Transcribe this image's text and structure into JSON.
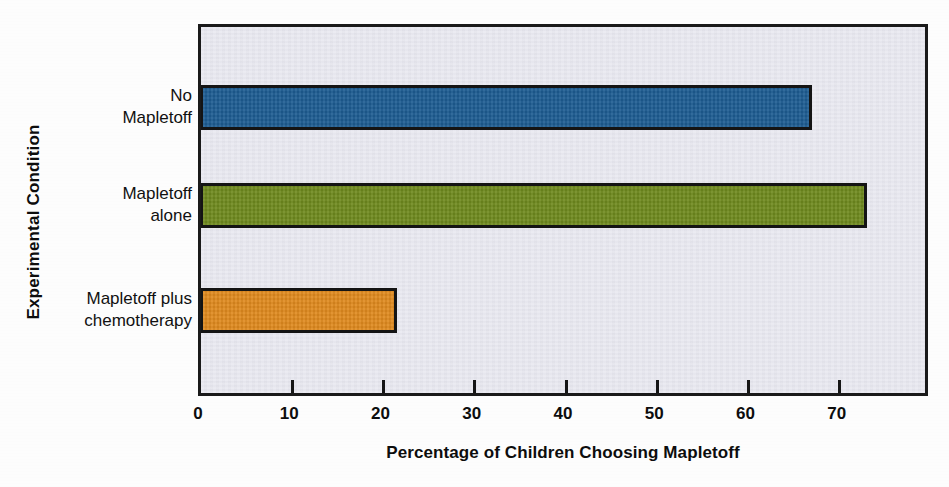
{
  "chart_data": {
    "type": "bar",
    "orientation": "horizontal",
    "title": "",
    "xlabel": "Percentage of Children Choosing Mapletoff",
    "ylabel": "Experimental Condition",
    "categories": [
      "No Mapletoff",
      "Mapletoff alone",
      "Mapletoff plus chemotherapy"
    ],
    "category_labels_wrapped": [
      "No\nMapletoff",
      "Mapletoff\nalone",
      "Mapletoff plus\nchemotherapy"
    ],
    "values": [
      67,
      73,
      21.5
    ],
    "bar_colors": [
      "#1d5c92",
      "#6f8a1e",
      "#e08a1e"
    ],
    "xlim": [
      0,
      80
    ],
    "xticks": [
      0,
      10,
      20,
      30,
      40,
      50,
      60,
      70
    ],
    "xtick_labels": [
      "0",
      "10",
      "20",
      "30",
      "40",
      "50",
      "60",
      "70"
    ],
    "grid": false,
    "legend": false,
    "plot_background": "#e7e7ef",
    "frame_color": "#1a1a1a",
    "bar_edge_color": "#141414"
  },
  "axes": {
    "y_title": "Experimental Condition",
    "x_title": "Percentage of Children Choosing Mapletoff"
  },
  "bars": [
    {
      "label": "No\nMapletoff",
      "value": 67,
      "color": "#1d5c92"
    },
    {
      "label": "Mapletoff\nalone",
      "value": 73,
      "color": "#6f8a1e"
    },
    {
      "label": "Mapletoff plus\nchemotherapy",
      "value": 21.5,
      "color": "#e08a1e"
    }
  ]
}
